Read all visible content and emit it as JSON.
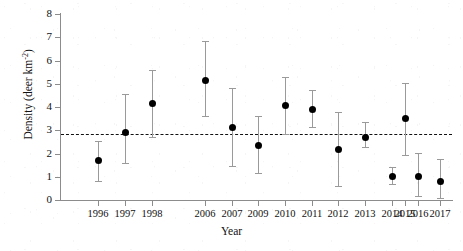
{
  "chart_data": {
    "type": "scatter",
    "title": "",
    "xlabel": "Year",
    "ylabel": "Density (deer km-2)",
    "ylabel_base": "Density (deer km",
    "ylabel_sup": "-2",
    "ylabel_close": ")",
    "ylim": [
      0,
      8
    ],
    "yticks": [
      0,
      1,
      2,
      3,
      4,
      5,
      6,
      7,
      8
    ],
    "ytick_labels": [
      "0",
      "1",
      "2",
      "3",
      "4",
      "5",
      "6",
      "7",
      "8"
    ],
    "grid": false,
    "legend": "none",
    "error_bar_style": "vertical line with caps (95% CI)",
    "marker_style": "filled black circle",
    "reference_line": {
      "value": 2.85,
      "style": "dashed",
      "color": "#111111",
      "orientation": "horizontal"
    },
    "categories": [
      "1996",
      "1997",
      "1998",
      "2006",
      "2007",
      "2009",
      "2010",
      "2011",
      "2012",
      "2013",
      "2014",
      "2015",
      "2016",
      "2017"
    ],
    "x_tick_labels": [
      "1996",
      "1997",
      "1998",
      "2006",
      "2007",
      "2009",
      "2010",
      "2011",
      "2012",
      "2013",
      "2014",
      "2015",
      "2016",
      "2017"
    ],
    "points": [
      {
        "year": "1996",
        "x_px": 98,
        "value": 1.7,
        "lower": 0.8,
        "upper": 2.55
      },
      {
        "year": "1997",
        "x_px": 125,
        "value": 2.92,
        "lower": 1.58,
        "upper": 4.55
      },
      {
        "year": "1998",
        "x_px": 152,
        "value": 4.18,
        "lower": 2.72,
        "upper": 5.58
      },
      {
        "year": "2006",
        "x_px": 205,
        "value": 5.18,
        "lower": 3.62,
        "upper": 6.82
      },
      {
        "year": "2007",
        "x_px": 232,
        "value": 3.12,
        "lower": 1.45,
        "upper": 4.82
      },
      {
        "year": "2009",
        "x_px": 258,
        "value": 2.38,
        "lower": 1.18,
        "upper": 3.62
      },
      {
        "year": "2010",
        "x_px": 285,
        "value": 4.08,
        "lower": 2.85,
        "upper": 5.28
      },
      {
        "year": "2011",
        "x_px": 312,
        "value": 3.9,
        "lower": 3.12,
        "upper": 4.75
      },
      {
        "year": "2012",
        "x_px": 338,
        "value": 2.18,
        "lower": 0.62,
        "upper": 3.78
      },
      {
        "year": "2013",
        "x_px": 365,
        "value": 2.72,
        "lower": 2.28,
        "upper": 3.35
      },
      {
        "year": "2014",
        "x_px": 392,
        "value": 1.02,
        "lower": 0.7,
        "upper": 1.42
      },
      {
        "year": "2015",
        "x_px": 405,
        "value": 3.52,
        "lower": 1.95,
        "upper": 5.05
      },
      {
        "year": "2016",
        "x_px": 418,
        "value": 1.02,
        "lower": 0.18,
        "upper": 2.02
      },
      {
        "year": "2017",
        "x_px": 440,
        "value": 0.82,
        "lower": 0.08,
        "upper": 1.78
      }
    ],
    "tick_x_px": [
      98,
      125,
      152,
      205,
      232,
      258,
      285,
      312,
      338,
      365,
      392,
      405,
      418,
      440
    ],
    "marker_x_px": [
      98,
      125,
      152,
      205,
      232,
      258,
      285,
      312,
      338,
      365,
      392,
      418,
      440
    ]
  }
}
